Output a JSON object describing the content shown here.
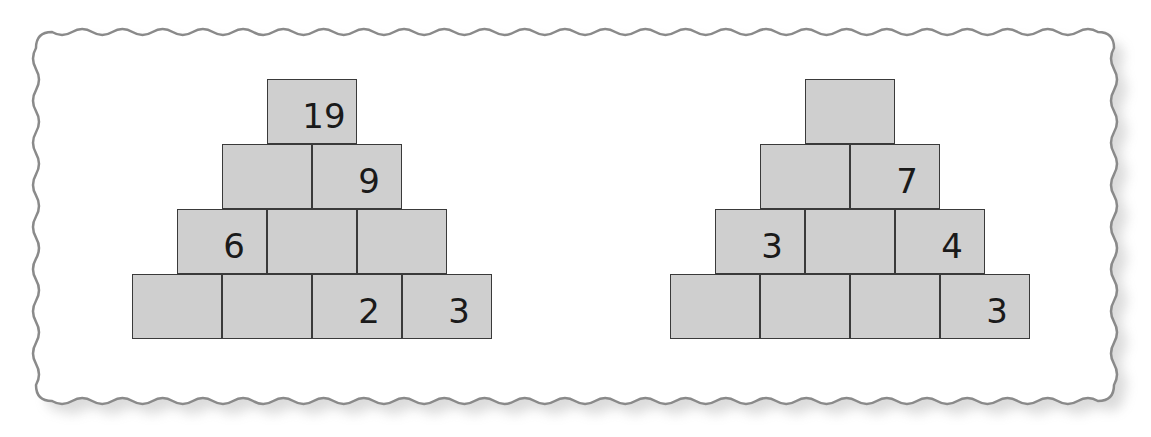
{
  "colors": {
    "cell_fill": "#cfcfcf",
    "cell_border": "#3a3a3a",
    "frame_border": "#8a8a8a",
    "text": "#1a1a1a"
  },
  "pyramids": [
    {
      "name": "left-pyramid",
      "rows": [
        [
          "19"
        ],
        [
          "",
          "9"
        ],
        [
          "6",
          "",
          ""
        ],
        [
          "",
          "",
          "2",
          "3"
        ]
      ]
    },
    {
      "name": "right-pyramid",
      "rows": [
        [
          ""
        ],
        [
          "",
          "7"
        ],
        [
          "3",
          "",
          "4"
        ],
        [
          "",
          "",
          "",
          "3"
        ]
      ]
    }
  ]
}
